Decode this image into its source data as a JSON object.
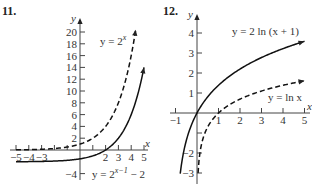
{
  "chart_data": [
    {
      "type": "line",
      "number": "11.",
      "xlabel": "x",
      "ylabel": "y",
      "xlim": [
        -5,
        5
      ],
      "ylim": [
        -4,
        20
      ],
      "x_ticks": [
        -5,
        -4,
        -3,
        -2,
        -1,
        1,
        2,
        3,
        4,
        5
      ],
      "x_tick_labels": [
        "−5",
        "−4",
        "−3",
        "2",
        "3",
        "4",
        "5"
      ],
      "x_tick_label_values": [
        -5,
        -4,
        -3,
        2,
        3,
        4,
        5
      ],
      "y_ticks": [
        -4,
        2,
        4,
        6,
        8,
        10,
        12,
        14,
        16,
        18,
        20
      ],
      "y_tick_labels": [
        "−4",
        "2",
        "4",
        "6",
        "8",
        "10",
        "12",
        "14",
        "16",
        "18",
        "20"
      ],
      "series": [
        {
          "name": "y = 2^x",
          "label_base": "y = 2",
          "label_exp": "x",
          "style": "dashed",
          "expr": "2^x",
          "x_range": [
            -5,
            4.35
          ]
        },
        {
          "name": "y = 2^(x−1) − 2",
          "label_base": "y = 2",
          "label_exp": "x−1",
          "label_tail": " − 2",
          "style": "solid",
          "expr": "2^(x-1)-2",
          "x_range": [
            -5,
            5
          ]
        }
      ]
    },
    {
      "type": "line",
      "number": "12.",
      "xlabel": "x",
      "ylabel": "y",
      "xlim": [
        -1,
        5
      ],
      "ylim": [
        -3,
        4
      ],
      "x_ticks": [
        -1,
        1,
        2,
        3,
        4,
        5
      ],
      "x_tick_labels": [
        "−1",
        "1",
        "2",
        "3",
        "4",
        "5"
      ],
      "y_ticks": [
        -3,
        -2,
        -1,
        1,
        2,
        3,
        4
      ],
      "y_tick_labels": [
        "−3",
        "−2",
        "",
        "1",
        "2",
        "3",
        "4"
      ],
      "series": [
        {
          "name": "y = 2 ln (x + 1)",
          "label": "y = 2 ln (x + 1)",
          "style": "solid",
          "expr": "2ln(x+1)",
          "x_range": [
            -0.78,
            5
          ]
        },
        {
          "name": "y = ln x",
          "label": "y = ln x",
          "style": "dashed",
          "expr": "ln(x)",
          "x_range": [
            0.05,
            5
          ]
        }
      ]
    }
  ]
}
